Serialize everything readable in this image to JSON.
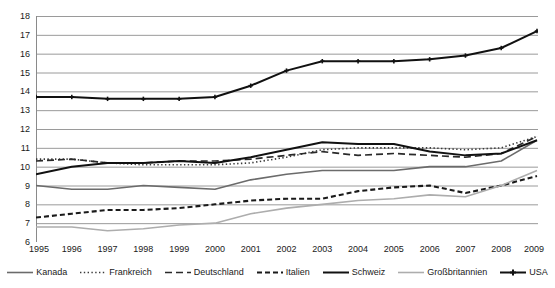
{
  "chart_data": {
    "type": "line",
    "title": "",
    "subtitle": "",
    "xlabel": "",
    "ylabel": "",
    "xlim": [
      1995,
      2009
    ],
    "ylim": [
      6,
      18
    ],
    "yticks": [
      6,
      7,
      8,
      9,
      10,
      11,
      12,
      13,
      14,
      15,
      16,
      17,
      18
    ],
    "grid": true,
    "grid_axis": "y",
    "legend_position": "bottom",
    "x": [
      1995,
      1996,
      1997,
      1998,
      1999,
      2000,
      2001,
      2002,
      2003,
      2004,
      2005,
      2006,
      2007,
      2008,
      2009
    ],
    "categories": [
      "1995",
      "1996",
      "1997",
      "1998",
      "1999",
      "2000",
      "2001",
      "2002",
      "2003",
      "2004",
      "2005",
      "2006",
      "2007",
      "2008",
      "2009"
    ],
    "series": [
      {
        "name": "Kanada",
        "color": "#6b6b6b",
        "style": "solid",
        "width": 1.6,
        "marker": "none",
        "values": [
          9.0,
          8.8,
          8.8,
          9.0,
          8.9,
          8.8,
          9.3,
          9.6,
          9.8,
          9.8,
          9.8,
          10.0,
          10.0,
          10.3,
          11.4
        ]
      },
      {
        "name": "Frankreich",
        "color": "#3a3a3a",
        "style": "dotted",
        "width": 1.6,
        "marker": "none",
        "values": [
          10.4,
          10.4,
          10.2,
          10.1,
          10.1,
          10.1,
          10.2,
          10.5,
          10.9,
          11.0,
          11.0,
          11.0,
          10.9,
          11.0,
          11.6
        ]
      },
      {
        "name": "Deutschland",
        "color": "#2a2a2a",
        "style": "dashed-long",
        "width": 1.7,
        "marker": "none",
        "values": [
          10.3,
          10.4,
          10.2,
          10.2,
          10.3,
          10.3,
          10.4,
          10.6,
          10.8,
          10.6,
          10.7,
          10.6,
          10.5,
          10.7,
          11.6
        ]
      },
      {
        "name": "Italien",
        "color": "#1a1a1a",
        "style": "dashed-short",
        "width": 2.1,
        "marker": "none",
        "values": [
          7.3,
          7.5,
          7.7,
          7.7,
          7.8,
          8.0,
          8.2,
          8.3,
          8.3,
          8.7,
          8.9,
          9.0,
          8.6,
          9.0,
          9.5
        ]
      },
      {
        "name": "Schweiz",
        "color": "#111111",
        "style": "solid",
        "width": 2.0,
        "marker": "none",
        "values": [
          9.6,
          10.0,
          10.2,
          10.2,
          10.3,
          10.2,
          10.5,
          10.9,
          11.3,
          11.2,
          11.2,
          10.8,
          10.6,
          10.7,
          11.4
        ]
      },
      {
        "name": "Großbritannien",
        "color": "#adadad",
        "style": "solid",
        "width": 1.6,
        "marker": "none",
        "values": [
          6.8,
          6.8,
          6.6,
          6.7,
          6.9,
          7.0,
          7.5,
          7.8,
          8.0,
          8.2,
          8.3,
          8.5,
          8.4,
          9.0,
          9.8
        ]
      },
      {
        "name": "USA",
        "color": "#111111",
        "style": "solid",
        "width": 2.0,
        "marker": "cross",
        "values": [
          13.7,
          13.7,
          13.6,
          13.6,
          13.6,
          13.7,
          14.3,
          15.1,
          15.6,
          15.6,
          15.6,
          15.7,
          15.9,
          16.3,
          17.2
        ]
      }
    ]
  }
}
